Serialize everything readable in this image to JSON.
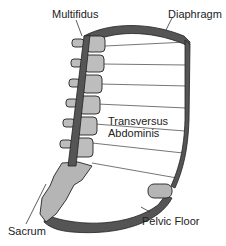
{
  "diagram": {
    "labels": {
      "multifidus": "Multifidus",
      "diaphragm": "Diaphragm",
      "transversus_line1": "Transversus",
      "transversus_line2": "Abdominis",
      "pelvic_floor": "Pelvic Floor",
      "sacrum": "Sacrum"
    },
    "structures": [
      {
        "name": "multifidus",
        "type": "muscle",
        "color": "#555555"
      },
      {
        "name": "diaphragm",
        "type": "muscle",
        "color": "#555555"
      },
      {
        "name": "transversus-abdominis",
        "type": "muscle",
        "color": "#555555"
      },
      {
        "name": "pelvic-floor",
        "type": "muscle",
        "color": "#555555"
      },
      {
        "name": "sacrum",
        "type": "bone",
        "color": "#b5b5b5"
      },
      {
        "name": "vertebrae",
        "type": "bone",
        "count": 6,
        "color": "#bdbdbd"
      }
    ],
    "colors": {
      "muscle": "#555555",
      "bone": "#bdbdbd",
      "outline": "#222222",
      "background": "#ffffff"
    }
  }
}
